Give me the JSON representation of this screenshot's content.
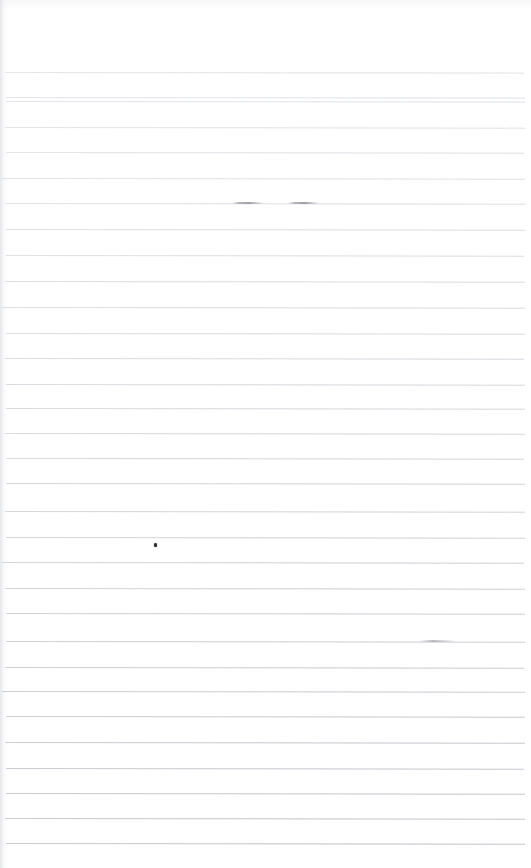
{
  "document": {
    "kind": "scanned-ruled-paper",
    "title": "Blank ruled notebook page",
    "page_width": 531,
    "page_height": 868,
    "background_color": "#ffffff",
    "content_text": "",
    "is_blank": true
  },
  "ruling": {
    "line_color": "#c9cbd0",
    "line_color_bottom": "#a9abb1",
    "line_thickness": 1,
    "spacing": 25.6,
    "first_line_y": 72,
    "last_line_y": 843,
    "line_count": 31,
    "left_margin": 5,
    "right_margin": 6,
    "top_margin": 72,
    "vertical_margin_rule": false,
    "line_y_positions": [
      72,
      97,
      101,
      127,
      152,
      178,
      203,
      229,
      255,
      281,
      307,
      333,
      358,
      384,
      408,
      433,
      458,
      483,
      511,
      537,
      562,
      588,
      613,
      641,
      667,
      691,
      716,
      742,
      768,
      793,
      818,
      843
    ]
  },
  "marks": [
    {
      "name": "ink-speck",
      "type": "ink-speck",
      "x": 154,
      "y": 543,
      "width": 3,
      "height": 4,
      "color": "#2d2d30"
    },
    {
      "name": "pencil-dash-left",
      "type": "pencil-dash",
      "x": 232,
      "y": 202,
      "width": 31,
      "height": 2,
      "color": "#8e9096"
    },
    {
      "name": "pencil-dash-right",
      "type": "pencil-dash",
      "x": 288,
      "y": 202,
      "width": 31,
      "height": 2,
      "color": "#8e9096"
    },
    {
      "name": "line-smudge-right",
      "type": "line-smudge",
      "x": 420,
      "y": 640,
      "width": 36,
      "height": 2,
      "color": "#9fa1a7"
    }
  ]
}
